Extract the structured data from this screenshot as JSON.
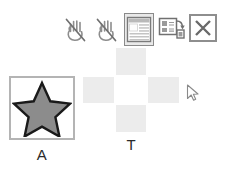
{
  "toolbar": {
    "items": [
      {
        "name": "no-hand-icon",
        "label": "Do not touch",
        "selected": false
      },
      {
        "name": "no-hand-icon-2",
        "label": "Do not touch",
        "selected": false
      },
      {
        "name": "list-window-icon",
        "label": "Show list",
        "selected": true
      },
      {
        "name": "copy-to-icon",
        "label": "Copy to",
        "selected": false
      },
      {
        "name": "close-icon",
        "label": "Close",
        "selected": false
      }
    ]
  },
  "panels": {
    "source": {
      "label": "A",
      "shape": "star",
      "shape_fill": "#8c8c8c",
      "shape_stroke": "#1a1a1a",
      "border_color": "#b4b4b4",
      "background": "#ffffff"
    },
    "target": {
      "label": "T",
      "rows": 3,
      "cols": 3,
      "cell_on_color": "#ececec",
      "cell_off_color": "#ffffff",
      "cells": [
        [
          0,
          1,
          0
        ],
        [
          1,
          0,
          1
        ],
        [
          0,
          1,
          0
        ]
      ]
    }
  },
  "cursor": {
    "name": "mouse-pointer",
    "x": 186,
    "y": 84
  }
}
